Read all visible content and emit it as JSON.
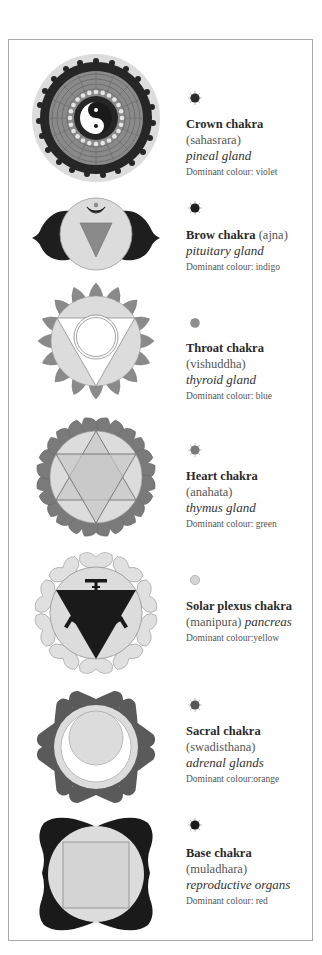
{
  "chakras": [
    {
      "id": "crown",
      "title": "Crown chakra",
      "sanskrit": "(sahasrara)",
      "gland": "pineal gland",
      "colour_label": "Dominant colour: violet",
      "dot_color": "#2a2a2a",
      "dot_style": "rayed"
    },
    {
      "id": "brow",
      "title": "Brow chakra",
      "sanskrit": "(ajna)",
      "gland": "pituitary gland",
      "colour_label": "Dominant colour: indigo",
      "dot_color": "#1e1e1e",
      "dot_style": "rayed"
    },
    {
      "id": "throat",
      "title": "Throat chakra",
      "sanskrit": "(vishuddha)",
      "gland": "thyroid gland",
      "colour_label": "Dominant colour: blue",
      "dot_color": "#8e8e8e",
      "dot_style": "plain"
    },
    {
      "id": "heart",
      "title": "Heart chakra",
      "sanskrit": "(anahata)",
      "gland": "thymus gland",
      "colour_label": "Dominant colour: green",
      "dot_color": "#7a7a7a",
      "dot_style": "rayed"
    },
    {
      "id": "solar-plexus",
      "title": "Solar plexus chakra",
      "sanskrit": "(manipura)",
      "gland": "pancreas",
      "colour_label": "Dominant colour:yellow",
      "dot_color": "#d4d4d4",
      "dot_style": "outline"
    },
    {
      "id": "sacral",
      "title": "Sacral chakra",
      "sanskrit": "(swadisthana)",
      "gland": "adrenal glands",
      "colour_label": "Dominant colour:orange",
      "dot_color": "#555555",
      "dot_style": "rayed"
    },
    {
      "id": "base",
      "title": "Base chakra",
      "sanskrit": "(muladhara)",
      "gland": "reproductive organs",
      "colour_label": "Dominant colour: red",
      "dot_color": "#1a1a1a",
      "dot_style": "rayed"
    }
  ],
  "colors": {
    "frame_border": "#a8a8a8",
    "light_grey": "#dcdcdc",
    "mid_grey": "#8a8a8a",
    "dark_grey": "#5a5a5a",
    "black": "#1a1a1a"
  }
}
